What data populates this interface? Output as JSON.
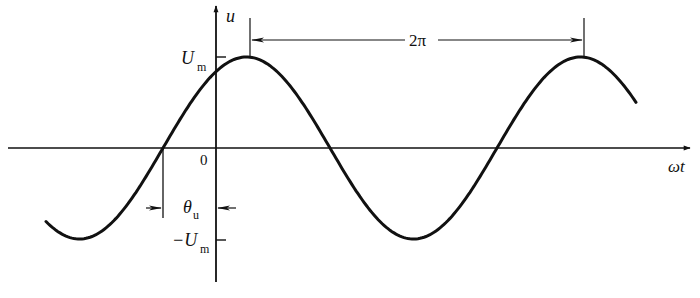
{
  "diagram": {
    "type": "sine-waveform",
    "axes": {
      "y_label": "u",
      "x_label": "ωt",
      "origin_label": "0"
    },
    "levels": {
      "max_label_main": "U",
      "max_label_sub": "m",
      "min_label_main": "−U",
      "min_label_sub": "m"
    },
    "period_annotation": {
      "label": "2π"
    },
    "phase_annotation": {
      "label_main": "θ",
      "label_sub": "u"
    },
    "colors": {
      "stroke": "#111111",
      "background": "#ffffff"
    },
    "geometry": {
      "x_axis_y": 148,
      "y_axis_x": 216,
      "amplitude_px": 91,
      "period_px": 334,
      "zero_crossing_x": 163,
      "curve_start_x": 46,
      "curve_end_x": 636
    }
  }
}
